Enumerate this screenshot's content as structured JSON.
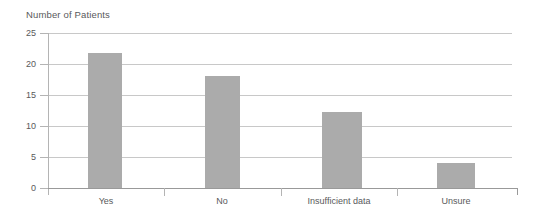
{
  "chart_data": {
    "type": "bar",
    "title": "Number of Patients",
    "xlabel": "",
    "ylabel": "Number of Patients",
    "categories": [
      "Yes",
      "No",
      "Insufficient data",
      "Unsure"
    ],
    "values": [
      21.7,
      18,
      12.3,
      4
    ],
    "ylim": [
      0,
      25
    ],
    "yticks": [
      0,
      5,
      10,
      15,
      20,
      25
    ],
    "ytick_labels": [
      "0",
      "5",
      "10",
      "15",
      "20",
      "25"
    ],
    "grid": true,
    "legend": "none",
    "bar_color": "#ababab",
    "gridline_color": "#c8c8c8",
    "axis_color": "#999999",
    "text_color": "#59595b"
  }
}
